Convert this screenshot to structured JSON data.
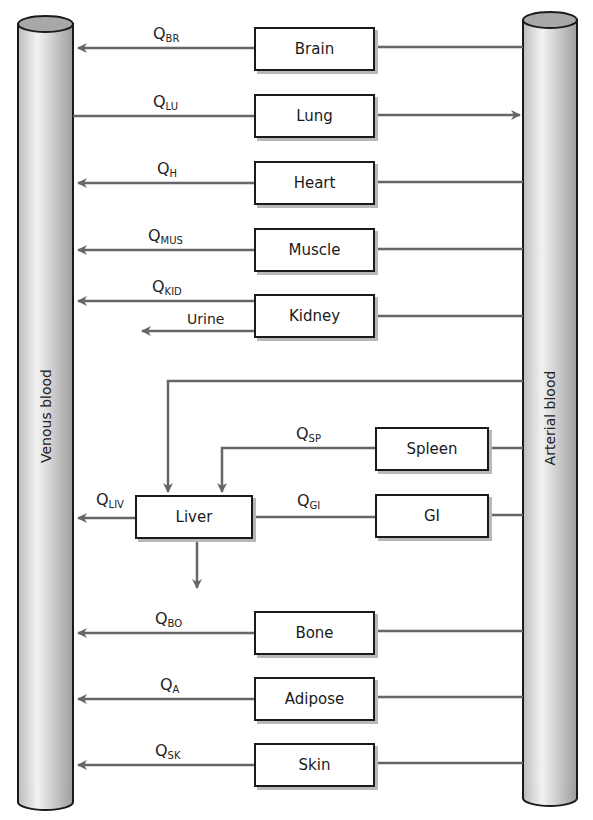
{
  "colors": {
    "line": "#666666",
    "box_border": "#1a1a1a",
    "shadow": "#b8b8b8",
    "cylinder_fill": "#d8d8d8"
  },
  "compartments": {
    "venous": {
      "label": "Venous blood"
    },
    "arterial": {
      "label": "Arterial blood"
    }
  },
  "organs": [
    {
      "id": "brain",
      "label": "Brain",
      "flow": "Q",
      "flow_sub": "BR"
    },
    {
      "id": "lung",
      "label": "Lung",
      "flow": "Q",
      "flow_sub": "LU"
    },
    {
      "id": "heart",
      "label": "Heart",
      "flow": "Q",
      "flow_sub": "H"
    },
    {
      "id": "muscle",
      "label": "Muscle",
      "flow": "Q",
      "flow_sub": "MUS"
    },
    {
      "id": "kidney",
      "label": "Kidney",
      "flow": "Q",
      "flow_sub": "KID"
    },
    {
      "id": "spleen",
      "label": "Spleen",
      "flow": "Q",
      "flow_sub": "SP"
    },
    {
      "id": "gi",
      "label": "GI",
      "flow": "Q",
      "flow_sub": "GI"
    },
    {
      "id": "liver",
      "label": "Liver",
      "flow": "Q",
      "flow_sub": "LIV"
    },
    {
      "id": "bone",
      "label": "Bone",
      "flow": "Q",
      "flow_sub": "BO"
    },
    {
      "id": "adipose",
      "label": "Adipose",
      "flow": "Q",
      "flow_sub": "A"
    },
    {
      "id": "skin",
      "label": "Skin",
      "flow": "Q",
      "flow_sub": "SK"
    }
  ],
  "urine_label": "Urine"
}
